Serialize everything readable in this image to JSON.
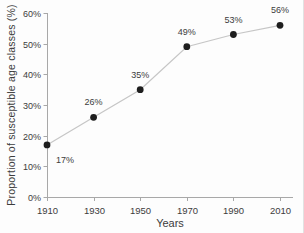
{
  "chart_data": {
    "type": "line",
    "title": "",
    "x": [
      1910,
      1930,
      1950,
      1970,
      1990,
      2010
    ],
    "series": [
      {
        "name": "Proportion of susceptible age classes",
        "values": [
          17,
          26,
          35,
          49,
          53,
          56
        ]
      }
    ],
    "point_labels": [
      "17%",
      "26%",
      "35%",
      "49%",
      "53%",
      "56%"
    ],
    "label_placement": [
      "below-right",
      "above",
      "above",
      "above",
      "above",
      "above"
    ],
    "xlabel": "Years",
    "ylabel": "Proportion of susceptible age classes (%)",
    "xlim": [
      1910,
      2015
    ],
    "ylim": [
      0,
      60
    ],
    "yticks": [
      0,
      10,
      20,
      30,
      40,
      50,
      60
    ],
    "ytick_labels": [
      "0%",
      "10%",
      "20%",
      "30%",
      "40%",
      "50%",
      "60%"
    ],
    "xticks": [
      1910,
      1930,
      1950,
      1970,
      1990,
      2010
    ],
    "xtick_labels": [
      "1910",
      "1930",
      "1950",
      "1970",
      "1990",
      "2010"
    ],
    "grid": false,
    "legend": "none",
    "marker": "filled-circle",
    "colors": {
      "line": "#c6c6c6",
      "point": "#1e1e1e",
      "axis": "#a8a8a8",
      "tick": "#a8a8a8",
      "text": "#3c3c3c",
      "background": "#fdfdfd"
    }
  }
}
